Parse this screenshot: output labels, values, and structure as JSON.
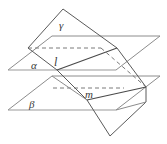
{
  "figure": {
    "name": "three-planes-intersection-diagram",
    "width": 167,
    "height": 144,
    "background_color": "#ffffff",
    "stroke_color_solid": "#4a4a4a",
    "stroke_color_plane_edge": "#8c8c8c",
    "stroke_color_dashed": "#7a7a7a",
    "label_color": "#3a3a3a"
  },
  "labels": {
    "gamma": "γ",
    "alpha": "α",
    "beta": "β",
    "line_l": "l",
    "line_m": "m"
  },
  "geometry": {
    "plane_alpha": {
      "name": "plane-alpha",
      "points": "8,70 52,36 160,36 116,70",
      "label": "α"
    },
    "plane_beta": {
      "name": "plane-beta",
      "points": "8,110 52,76 160,76 116,110",
      "label": "β"
    },
    "plane_gamma": {
      "name": "plane-gamma",
      "points": "63,9 117,48 104,104 50,65",
      "label": "γ"
    },
    "intersection_line_l": {
      "name": "intersection-line-l",
      "from": "50,65",
      "to": "117,48",
      "label": "l"
    },
    "intersection_line_m": {
      "name": "intersection-line-m",
      "from": "78,105",
      "to": "145,88",
      "label": "m"
    },
    "hidden_edges_dashed": [
      "28,48 100,48",
      "100,48 146,86",
      "52,88 123,88"
    ]
  }
}
